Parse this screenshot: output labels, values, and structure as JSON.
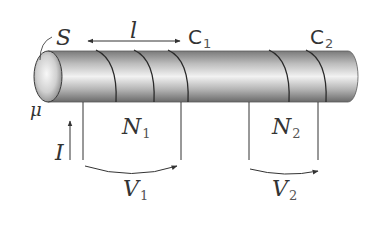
{
  "figure": {
    "type": "solenoid-core-diagram",
    "core": {
      "label_area": "S",
      "label_permeability": "μ",
      "label_length": "l",
      "color_light": "#f4f4f4",
      "color_dark": "#6e6e6e",
      "outline": "#3a3a3a"
    },
    "coils": [
      {
        "id": "C1",
        "name": "C",
        "subscript": "1",
        "turns_label": "N",
        "turns_sub": "1",
        "voltage_label": "V",
        "voltage_sub": "1"
      },
      {
        "id": "C2",
        "name": "C",
        "subscript": "2",
        "turns_label": "N",
        "turns_sub": "2",
        "voltage_label": "V",
        "voltage_sub": "2"
      }
    ],
    "current": {
      "label": "I",
      "direction": "up"
    },
    "stroke_color": "#333333"
  }
}
